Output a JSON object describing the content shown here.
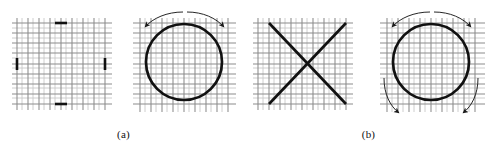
{
  "figure": {
    "title": "",
    "background_color": "#ffffff",
    "width": 491,
    "height": 151,
    "captions": [
      {
        "id": "a",
        "label": "(a)"
      },
      {
        "id": "b",
        "label": "(b)"
      }
    ],
    "colors": {
      "grid_major": "#8c8c8c",
      "grid_minor": "#c8c8c8",
      "stroke_dark": "#111111",
      "arrow": "#1a1a1a",
      "caption_text": "#111111"
    },
    "panels": [
      {
        "id": "panel-1",
        "name": "undeformed-grid-with-load-markers",
        "description": "Square mesh grid with four short bold tick marks at top, bottom, left and right mid-edges",
        "grid": {
          "columns": 9,
          "rows": 9
        },
        "markers": [
          {
            "name": "marker-top",
            "orientation": "horizontal"
          },
          {
            "name": "marker-bottom",
            "orientation": "horizontal"
          },
          {
            "name": "marker-left",
            "orientation": "vertical"
          },
          {
            "name": "marker-right",
            "orientation": "vertical"
          }
        ]
      },
      {
        "id": "panel-2",
        "name": "deformed-grid-circle-two-arrows",
        "description": "Mesh grid overlaid with a heavy circle and two curved arrows arcing over the top pointing outward-downward",
        "grid": {
          "columns": 9,
          "rows": 9
        },
        "circle": {
          "cx": 61,
          "cy": 62,
          "r": 38
        },
        "arrows": [
          {
            "name": "arrow-top-left",
            "direction": "down-left"
          },
          {
            "name": "arrow-top-right",
            "direction": "down-right"
          }
        ]
      },
      {
        "id": "panel-3",
        "name": "grid-with-diagonal-cross",
        "description": "Mesh grid with two heavy diagonal lines forming an X",
        "grid": {
          "columns": 9,
          "rows": 9
        },
        "lines": [
          {
            "name": "diagonal-down-right"
          },
          {
            "name": "diagonal-up-right"
          }
        ]
      },
      {
        "id": "panel-4",
        "name": "deformed-grid-circle-four-arrows",
        "description": "Mesh grid overlaid with a heavy circle and four curved arrows at the upper and lower corners indicating shear rotation",
        "grid": {
          "columns": 9,
          "rows": 9
        },
        "circle": {
          "cx": 61,
          "cy": 62,
          "r": 38
        },
        "arrows": [
          {
            "name": "arrow-top-left",
            "direction": "down-left"
          },
          {
            "name": "arrow-top-right",
            "direction": "down-right"
          },
          {
            "name": "arrow-bottom-left",
            "direction": "down-right"
          },
          {
            "name": "arrow-bottom-right",
            "direction": "up-right"
          }
        ]
      }
    ]
  }
}
